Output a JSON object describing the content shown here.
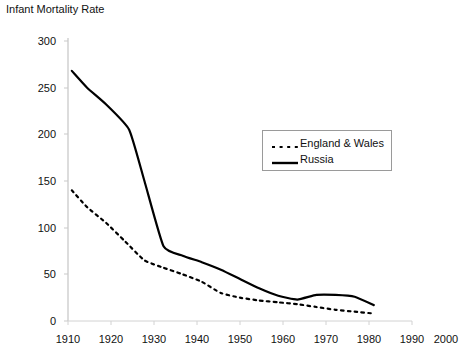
{
  "chart_data": {
    "type": "line",
    "title": "Infant Mortality Rate",
    "xlabel": "",
    "ylabel": "",
    "xlim": [
      1910,
      2000
    ],
    "ylim": [
      0,
      300
    ],
    "grid": false,
    "legend_position": "center-right",
    "x_ticks": [
      "1910",
      "1920",
      "1930",
      "1940",
      "1950",
      "1960",
      "1970",
      "1980",
      "1990",
      "2000"
    ],
    "y_ticks": [
      "0",
      "50",
      "100",
      "150",
      "200",
      "250",
      "300"
    ],
    "series": [
      {
        "name": "England & Wales",
        "style": "dotted",
        "color": "#000000",
        "x": [
          1911,
          1915,
          1920,
          1925,
          1930,
          1935,
          1940,
          1945,
          1950,
          1955,
          1960,
          1965,
          1970,
          1975,
          1980,
          1985,
          1990
        ],
        "values": [
          140,
          122,
          105,
          85,
          65,
          57,
          50,
          42,
          30,
          25,
          22,
          20,
          18,
          15,
          12,
          10,
          8
        ]
      },
      {
        "name": "Russia",
        "style": "solid",
        "color": "#000000",
        "x": [
          1911,
          1915,
          1920,
          1926,
          1930,
          1935,
          1940,
          1945,
          1950,
          1955,
          1960,
          1965,
          1970,
          1975,
          1980,
          1985,
          1990
        ],
        "values": [
          268,
          250,
          232,
          205,
          150,
          80,
          70,
          63,
          55,
          45,
          35,
          27,
          23,
          28,
          28,
          26,
          17
        ]
      }
    ]
  },
  "legend": {
    "entries": [
      {
        "label": "England & Wales"
      },
      {
        "label": "Russia"
      }
    ]
  },
  "axes": {
    "y_tick_300": "300",
    "y_tick_250": "250",
    "y_tick_200": "200",
    "y_tick_150": "150",
    "y_tick_100": "100",
    "y_tick_50": "50",
    "y_tick_0": "0",
    "x_tick_1910": "1910",
    "x_tick_1920": "1920",
    "x_tick_1930": "1930",
    "x_tick_1940": "1940",
    "x_tick_1950": "1950",
    "x_tick_1960": "1960",
    "x_tick_1970": "1970",
    "x_tick_1980": "1980",
    "x_tick_1990": "1990",
    "x_tick_2000": "2000"
  }
}
